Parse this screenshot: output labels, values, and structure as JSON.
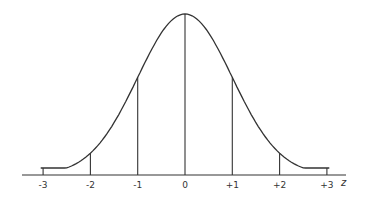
{
  "chart_data": {
    "type": "line",
    "title": "",
    "xlabel": "z",
    "ylabel": "",
    "x": [
      -3,
      -2,
      -1,
      0,
      1,
      2,
      3
    ],
    "tick_labels": [
      "-3",
      "-2",
      "-1",
      "0",
      "+1",
      "+2",
      "+3"
    ],
    "xlim": [
      -3,
      3
    ],
    "vertical_lines_at": [
      -3,
      -2,
      -1,
      0,
      1,
      2,
      3
    ],
    "grid": false,
    "legend": null
  },
  "axis": {
    "variable_label": "z"
  }
}
